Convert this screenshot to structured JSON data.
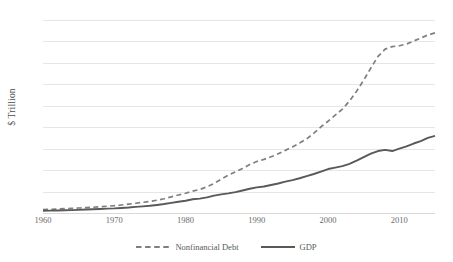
{
  "chart_data": {
    "type": "line",
    "title": "",
    "xlabel": "",
    "ylabel": "$ Trillion",
    "xlim": [
      1960,
      2015
    ],
    "ylim": [
      0,
      45
    ],
    "ytick_step": 5,
    "grid": true,
    "legend_position": "bottom",
    "yticks": [
      0,
      5,
      10,
      15,
      20,
      25,
      30,
      35,
      40,
      45
    ],
    "ytick_labels": [
      "0",
      "5",
      "10",
      "15",
      "20",
      "25",
      "30",
      "35",
      "40",
      "45"
    ],
    "xticks": [
      1960,
      1970,
      1980,
      1990,
      2000,
      2010
    ],
    "xtick_labels": [
      "1960",
      "1970",
      "1980",
      "1990",
      "2000",
      "2010"
    ],
    "x": [
      1960,
      1961,
      1962,
      1963,
      1964,
      1965,
      1966,
      1967,
      1968,
      1969,
      1970,
      1971,
      1972,
      1973,
      1974,
      1975,
      1976,
      1977,
      1978,
      1979,
      1980,
      1981,
      1982,
      1983,
      1984,
      1985,
      1986,
      1987,
      1988,
      1989,
      1990,
      1991,
      1992,
      1993,
      1994,
      1995,
      1996,
      1997,
      1998,
      1999,
      2000,
      2001,
      2002,
      2003,
      2004,
      2005,
      2006,
      2007,
      2008,
      2009,
      2010,
      2011,
      2012,
      2013,
      2014,
      2015
    ],
    "series": [
      {
        "name": "Nonfinancial Debt",
        "style": "dashed",
        "color": "#7f7f7f",
        "values": [
          0.8,
          0.85,
          0.92,
          1.0,
          1.08,
          1.16,
          1.24,
          1.33,
          1.45,
          1.58,
          1.7,
          1.87,
          2.06,
          2.28,
          2.49,
          2.7,
          2.98,
          3.33,
          3.75,
          4.2,
          4.6,
          5.1,
          5.5,
          6.1,
          6.9,
          7.9,
          8.8,
          9.6,
          10.4,
          11.3,
          12.0,
          12.5,
          13.1,
          13.8,
          14.6,
          15.4,
          16.3,
          17.3,
          18.6,
          20.1,
          21.4,
          22.8,
          24.2,
          26.1,
          28.4,
          31.0,
          33.8,
          36.5,
          38.2,
          38.8,
          39.0,
          39.4,
          40.1,
          40.8,
          41.5,
          42.0
        ]
      },
      {
        "name": "GDP",
        "style": "solid",
        "color": "#595959",
        "values": [
          0.54,
          0.56,
          0.6,
          0.64,
          0.68,
          0.74,
          0.81,
          0.86,
          0.94,
          1.02,
          1.07,
          1.17,
          1.28,
          1.43,
          1.55,
          1.69,
          1.88,
          2.09,
          2.36,
          2.63,
          2.86,
          3.21,
          3.35,
          3.64,
          4.04,
          4.34,
          4.58,
          4.86,
          5.25,
          5.66,
          5.98,
          6.17,
          6.54,
          6.88,
          7.31,
          7.66,
          8.1,
          8.61,
          9.09,
          9.66,
          10.25,
          10.58,
          10.94,
          11.46,
          12.22,
          13.04,
          13.82,
          14.45,
          14.71,
          14.45,
          14.99,
          15.54,
          16.2,
          16.78,
          17.52,
          18.0
        ]
      }
    ]
  },
  "legend": {
    "items": [
      {
        "label": "Nonfinancial Debt",
        "style": "dashed"
      },
      {
        "label": "GDP",
        "style": "solid"
      }
    ]
  },
  "colors": {
    "debt": "#7f7f7f",
    "gdp": "#595959",
    "gridline": "#e6e6e6",
    "baseline": "#d9d9d9",
    "text": "#6b6b6b",
    "background": "#ffffff"
  }
}
